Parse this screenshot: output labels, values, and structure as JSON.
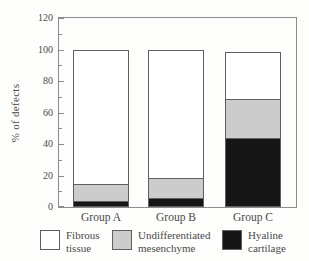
{
  "chart_data": {
    "type": "bar",
    "stacked": true,
    "title": "",
    "xlabel": "",
    "ylabel": "% of defects",
    "ylim": [
      0,
      120
    ],
    "yticks": [
      0,
      20,
      40,
      60,
      80,
      100,
      120
    ],
    "minor_yticks": [
      10,
      30,
      50,
      70,
      90,
      110
    ],
    "grid": false,
    "legend_position": "bottom",
    "categories": [
      "Group A",
      "Group B",
      "Group C"
    ],
    "series": [
      {
        "name": "Hyaline cartilage",
        "color": "#161616",
        "values": [
          3,
          5,
          43
        ]
      },
      {
        "name": "Undifferentiated mesenchyme",
        "color": "#cccccc",
        "values": [
          11,
          13,
          25
        ]
      },
      {
        "name": "Fibrous tissue",
        "color": "#ffffff",
        "values": [
          85,
          81,
          30
        ]
      }
    ],
    "bar_totals": [
      99,
      99,
      98
    ]
  },
  "legend": {
    "items": [
      {
        "label_line1": "Fibrous",
        "label_line2": "tissue",
        "color": "#ffffff"
      },
      {
        "label_line1": "Undifferentiated",
        "label_line2": "mesenchyme",
        "color": "#cccccc"
      },
      {
        "label_line1": "Hyaline",
        "label_line2": "cartilage",
        "color": "#161616"
      }
    ]
  },
  "colors": {
    "frame": "#8c8c8c",
    "segment_outline": "#5f5f5f",
    "text": "#4a4a4a",
    "background": "#fdfdfc"
  }
}
